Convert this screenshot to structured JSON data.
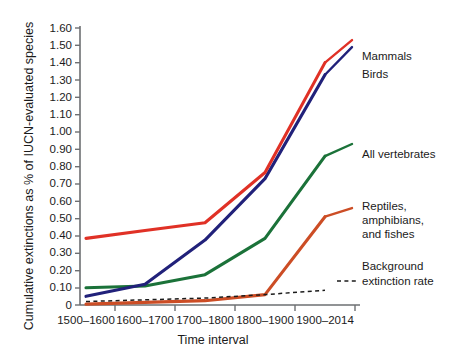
{
  "chart_data": {
    "type": "line",
    "title": "",
    "xlabel": "Time interval",
    "ylabel": "Cumulative extinctions as % of IUCN-evaluated species",
    "categories": [
      "1500–1600",
      "1600–1700",
      "1700–1800",
      "1800–1900",
      "1900–2014"
    ],
    "ylim": [
      0,
      1.6
    ],
    "yticks": [
      "0",
      "0.10",
      "0.20",
      "0.30",
      "0.40",
      "0.50",
      "0.60",
      "0.70",
      "0.80",
      "0.90",
      "1.00",
      "1.10",
      "1.20",
      "1.30",
      "1.40",
      "1.50",
      "1.60"
    ],
    "ytick_values": [
      0,
      0.1,
      0.2,
      0.3,
      0.4,
      0.5,
      0.6,
      0.7,
      0.8,
      0.9,
      1.0,
      1.1,
      1.2,
      1.3,
      1.4,
      1.5,
      1.6
    ],
    "grid": false,
    "legend_position": "right-inline-labels",
    "series": [
      {
        "name": "Mammals",
        "color": "#e03126",
        "style": "solid",
        "values": [
          0.385,
          0.43,
          0.475,
          0.765,
          1.4
        ]
      },
      {
        "name": "Birds",
        "color": "#21217a",
        "style": "solid",
        "values": [
          0.05,
          0.12,
          0.375,
          0.73,
          1.33
        ]
      },
      {
        "name": "All vertebrates",
        "color": "#1b7239",
        "style": "solid",
        "values": [
          0.1,
          0.11,
          0.175,
          0.385,
          0.86
        ]
      },
      {
        "name": "Reptiles, amphibians, and fishes",
        "color": "#cc4d25",
        "style": "solid",
        "values": [
          0.005,
          0.015,
          0.025,
          0.06,
          0.51
        ]
      },
      {
        "name": "Background extinction rate",
        "color": "#1b1b1b",
        "style": "dashed",
        "values": [
          0.02,
          0.03,
          0.04,
          0.06,
          0.085
        ]
      }
    ],
    "annotations": [
      {
        "text": "Mammals",
        "series": "Mammals"
      },
      {
        "text": "Birds",
        "series": "Birds"
      },
      {
        "text": "All vertebrates",
        "series": "All vertebrates"
      },
      {
        "text": "Reptiles,",
        "series": "Reptiles, amphibians, and fishes"
      },
      {
        "text": "amphibians,",
        "series": "Reptiles, amphibians, and fishes"
      },
      {
        "text": "and fishes",
        "series": "Reptiles, amphibians, and fishes"
      },
      {
        "text": "Background",
        "series": "Background extinction rate"
      },
      {
        "text": "extinction rate",
        "series": "Background extinction rate"
      }
    ]
  },
  "labels": {
    "y_axis_title": "Cumulative extinctions as % of IUCN-evaluated species",
    "x_axis_title": "Time interval",
    "series_mammals": "Mammals",
    "series_birds": "Birds",
    "series_all_vertebrates": "All vertebrates",
    "series_reptiles_l1": "Reptiles,",
    "series_reptiles_l2": "amphibians,",
    "series_reptiles_l3": "and fishes",
    "series_background_l1": "Background",
    "series_background_l2": "extinction rate"
  },
  "ticks": {
    "y": [
      "1.60",
      "1.50",
      "1.40",
      "1.30",
      "1.20",
      "1.10",
      "1.00",
      "0.90",
      "0.80",
      "0.70",
      "0.60",
      "0.50",
      "0.40",
      "0.30",
      "0.20",
      "0.10",
      "0"
    ],
    "x": [
      "1500–1600",
      "1600–1700",
      "1700–1800",
      "1800–1900",
      "1900–2014"
    ]
  },
  "colors": {
    "mammals": "#e03126",
    "birds": "#21217a",
    "all_vertebrates": "#1b7239",
    "reptiles": "#cc4d25",
    "background_rate": "#1b1b1b",
    "axis": "#6d6f72",
    "text": "#1b1b1b",
    "plot_background": "#ffffff"
  }
}
